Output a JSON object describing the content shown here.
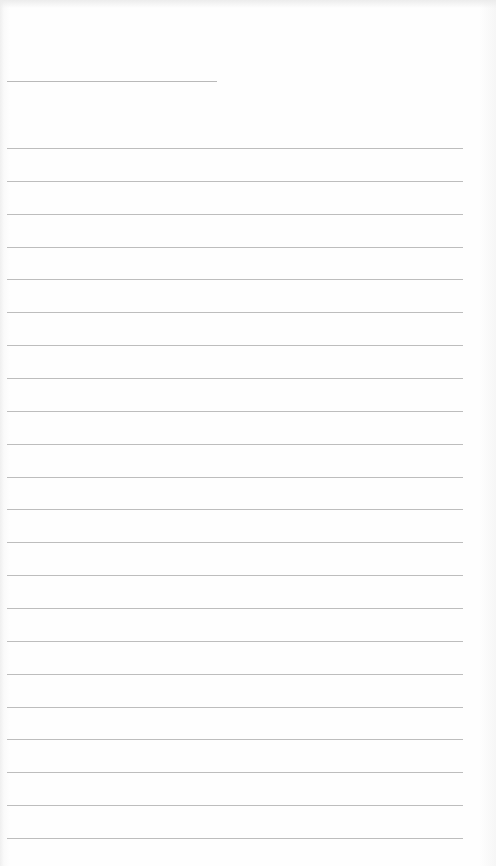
{
  "document": {
    "type": "blank ruled page",
    "header_line": {
      "label": ""
    },
    "ruled_lines": {
      "count": 22,
      "filled_text": []
    }
  }
}
